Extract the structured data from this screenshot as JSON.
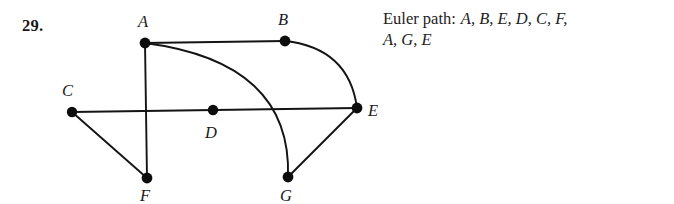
{
  "exercise": {
    "number": "29."
  },
  "graph": {
    "vertices": [
      {
        "id": "A",
        "label": "A",
        "cx": 145,
        "cy": 43,
        "label_x": 138,
        "label_y": 27
      },
      {
        "id": "B",
        "label": "B",
        "cx": 285,
        "cy": 41,
        "label_x": 278,
        "label_y": 25
      },
      {
        "id": "C",
        "label": "C",
        "cx": 72,
        "cy": 112,
        "label_x": 63,
        "label_y": 96
      },
      {
        "id": "D",
        "label": "D",
        "cx": 213,
        "cy": 110,
        "label_x": 205,
        "label_y": 137
      },
      {
        "id": "E",
        "label": "E",
        "cx": 357,
        "cy": 108,
        "label_x": 368,
        "label_y": 115
      },
      {
        "id": "F",
        "label": "F",
        "cx": 147,
        "cy": 178,
        "label_x": 140,
        "label_y": 200
      },
      {
        "id": "G",
        "label": "G",
        "cx": 288,
        "cy": 177,
        "label_x": 280,
        "label_y": 200
      }
    ],
    "edges": [
      {
        "from": "A",
        "to": "B",
        "shape": "straight"
      },
      {
        "from": "A",
        "to": "F",
        "shape": "straight"
      },
      {
        "from": "A",
        "to": "G",
        "shape": "curved"
      },
      {
        "from": "B",
        "to": "E",
        "shape": "curved"
      },
      {
        "from": "C",
        "to": "E",
        "shape": "straight"
      },
      {
        "from": "C",
        "to": "F",
        "shape": "straight"
      },
      {
        "from": "E",
        "to": "G",
        "shape": "straight"
      }
    ],
    "vertex_radius": 5.2,
    "edge_color": "#141414",
    "vertex_color": "#0d0d0d"
  },
  "answer": {
    "label": "Euler path:",
    "path_line_1": "A, B, E, D, C, F,",
    "path_line_2": "A, G, E",
    "full_path": "A, B, E, D, C, F, A, G, E"
  }
}
